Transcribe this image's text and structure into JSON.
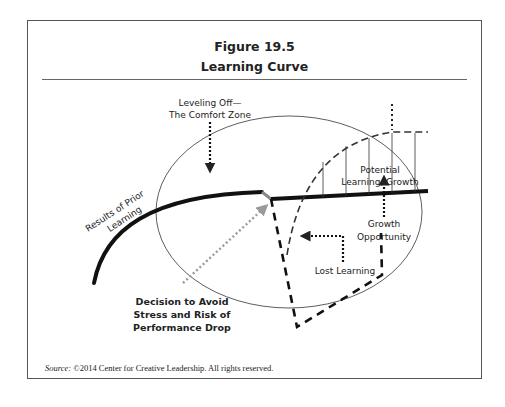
{
  "figure": {
    "number": "Figure 19.5",
    "title": "Learning Curve",
    "source_label": "Source:",
    "source_text": " ©2014 Center for Creative Leadership. All rights reserved."
  },
  "labels": {
    "prior_learning_1": "Results of Prior",
    "prior_learning_2": "Learning",
    "leveling_1": "Leveling Off—",
    "leveling_2": "The Comfort Zone",
    "potential_1": "Potential",
    "potential_2": "Learning, Growth",
    "growth_1": "Growth",
    "growth_2": "Opportunity",
    "lost": "Lost Learning",
    "decision_1": "Decision to Avoid",
    "decision_2": "Stress and Risk of",
    "decision_3": "Performance Drop"
  },
  "colors": {
    "ink": "#222222",
    "gray_arrow": "#9a9a9a",
    "frame": "#555555"
  }
}
